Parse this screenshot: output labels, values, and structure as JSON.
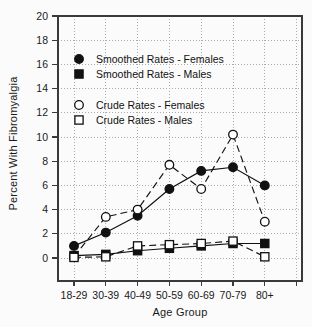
{
  "figure": {
    "background": "#fbfbfb",
    "frame_color": "#3a3a3a",
    "grid_color": "#ababab",
    "text_color": "#1a1a1a",
    "accent": "#111111",
    "open_marker_fill": "#ffffff"
  },
  "chart_data": {
    "type": "line",
    "title": "",
    "xlabel": "Age Group",
    "ylabel": "Percent With Fibromyalgia",
    "categories": [
      "18-29",
      "30-39",
      "40-49",
      "50-59",
      "60-69",
      "70-79",
      "80+"
    ],
    "yticks": [
      0,
      2,
      4,
      6,
      8,
      10,
      12,
      14,
      16,
      18,
      20
    ],
    "ylim": [
      -1.9,
      20
    ],
    "grid": true,
    "x_axis_extra_tick": true,
    "legend_position": "inside-top-left",
    "series": [
      {
        "name": "Smoothed Rates - Females",
        "marker": "filled-circle",
        "line": "solid",
        "values": [
          1.0,
          2.1,
          3.5,
          5.7,
          7.2,
          7.5,
          6.0
        ]
      },
      {
        "name": "Smoothed Rates - Males",
        "marker": "filled-square",
        "line": "solid",
        "values": [
          0.2,
          0.3,
          0.6,
          0.8,
          1.0,
          1.2,
          1.2
        ]
      },
      {
        "name": "Crude Rates - Females",
        "marker": "open-circle",
        "line": "dashed",
        "values": [
          0.1,
          3.4,
          4.0,
          7.7,
          5.7,
          10.2,
          3.0
        ]
      },
      {
        "name": "Crude Rates - Males",
        "marker": "open-square",
        "line": "dashed",
        "values": [
          0.05,
          0.1,
          1.0,
          1.1,
          1.2,
          1.4,
          0.1
        ]
      }
    ]
  }
}
